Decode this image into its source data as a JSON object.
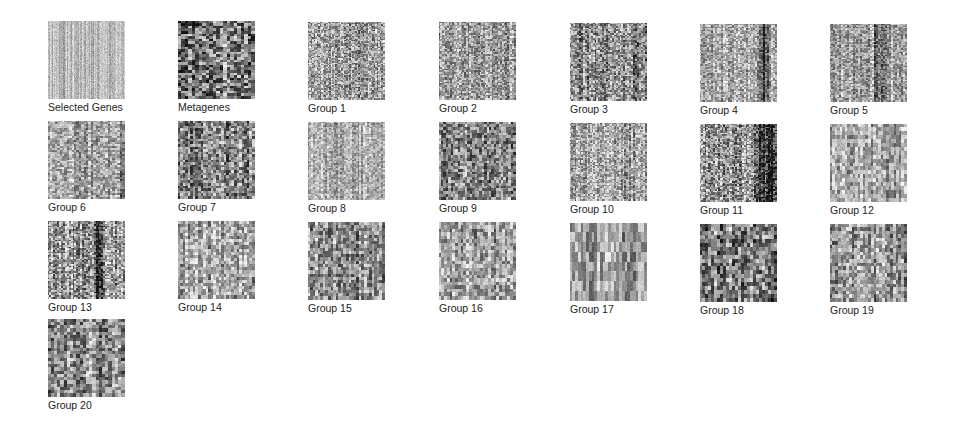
{
  "panel": {
    "title": "",
    "tiles": [
      {
        "label": "Selected Genes",
        "x": 48,
        "y": 21,
        "mean": 0.72,
        "contrast": 0.18,
        "cols": 77,
        "rows": 78,
        "stripes": []
      },
      {
        "label": "Metagenes",
        "x": 178,
        "y": 21,
        "mean": 0.45,
        "contrast": 0.75,
        "cols": 22,
        "rows": 30,
        "stripes": []
      },
      {
        "label": "Group 1",
        "x": 308,
        "y": 22,
        "mean": 0.62,
        "contrast": 0.55,
        "cols": 50,
        "rows": 55,
        "stripes": []
      },
      {
        "label": "Group 2",
        "x": 439,
        "y": 22,
        "mean": 0.62,
        "contrast": 0.5,
        "cols": 45,
        "rows": 48,
        "stripes": []
      },
      {
        "label": "Group 3",
        "x": 570,
        "y": 23,
        "mean": 0.55,
        "contrast": 0.6,
        "cols": 40,
        "rows": 45,
        "stripes": [
          0.85
        ]
      },
      {
        "label": "Group 4",
        "x": 700,
        "y": 24,
        "mean": 0.66,
        "contrast": 0.45,
        "cols": 40,
        "rows": 50,
        "stripes": [
          0.8,
          0.85
        ]
      },
      {
        "label": "Group 5",
        "x": 830,
        "y": 24,
        "mean": 0.64,
        "contrast": 0.45,
        "cols": 40,
        "rows": 50,
        "stripes": [
          0.6,
          0.7
        ]
      },
      {
        "label": "Group 6",
        "x": 48,
        "y": 121,
        "mean": 0.64,
        "contrast": 0.45,
        "cols": 32,
        "rows": 40,
        "stripes": [
          0.97
        ]
      },
      {
        "label": "Group 7",
        "x": 178,
        "y": 121,
        "mean": 0.5,
        "contrast": 0.6,
        "cols": 30,
        "rows": 30,
        "stripes": []
      },
      {
        "label": "Group 8",
        "x": 308,
        "y": 122,
        "mean": 0.68,
        "contrast": 0.35,
        "cols": 40,
        "rows": 45,
        "stripes": []
      },
      {
        "label": "Group 9",
        "x": 439,
        "y": 122,
        "mean": 0.52,
        "contrast": 0.6,
        "cols": 32,
        "rows": 28,
        "stripes": []
      },
      {
        "label": "Group 10",
        "x": 570,
        "y": 123,
        "mean": 0.63,
        "contrast": 0.5,
        "cols": 45,
        "rows": 50,
        "stripes": []
      },
      {
        "label": "Group 11",
        "x": 700,
        "y": 124,
        "mean": 0.58,
        "contrast": 0.65,
        "cols": 45,
        "rows": 50,
        "stripes": [
          0.75,
          0.8,
          0.85,
          0.9,
          0.95
        ]
      },
      {
        "label": "Group 12",
        "x": 830,
        "y": 124,
        "mean": 0.65,
        "contrast": 0.45,
        "cols": 30,
        "rows": 20,
        "stripes": []
      },
      {
        "label": "Group 13",
        "x": 48,
        "y": 221,
        "mean": 0.6,
        "contrast": 0.6,
        "cols": 40,
        "rows": 45,
        "stripes": [
          0.62,
          0.66
        ]
      },
      {
        "label": "Group 14",
        "x": 178,
        "y": 221,
        "mean": 0.64,
        "contrast": 0.5,
        "cols": 30,
        "rows": 25,
        "stripes": []
      },
      {
        "label": "Group 15",
        "x": 308,
        "y": 222,
        "mean": 0.58,
        "contrast": 0.55,
        "cols": 30,
        "rows": 24,
        "stripes": []
      },
      {
        "label": "Group 16",
        "x": 439,
        "y": 222,
        "mean": 0.6,
        "contrast": 0.5,
        "cols": 28,
        "rows": 22,
        "stripes": []
      },
      {
        "label": "Group 17",
        "x": 570,
        "y": 223,
        "mean": 0.62,
        "contrast": 0.45,
        "cols": 28,
        "rows": 8,
        "stripes": []
      },
      {
        "label": "Group 18",
        "x": 700,
        "y": 224,
        "mean": 0.5,
        "contrast": 0.65,
        "cols": 26,
        "rows": 20,
        "stripes": []
      },
      {
        "label": "Group 19",
        "x": 830,
        "y": 224,
        "mean": 0.58,
        "contrast": 0.55,
        "cols": 28,
        "rows": 22,
        "stripes": []
      },
      {
        "label": "Group 20",
        "x": 48,
        "y": 319,
        "mean": 0.56,
        "contrast": 0.6,
        "cols": 24,
        "rows": 24,
        "stripes": []
      }
    ]
  },
  "colors": {
    "background": "#ffffff",
    "label": "#222222"
  }
}
